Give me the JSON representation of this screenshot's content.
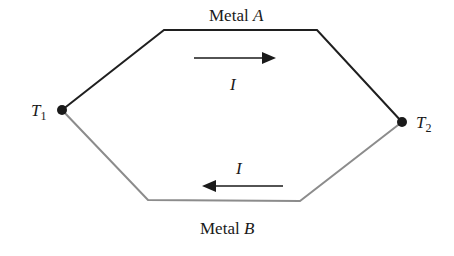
{
  "diagram": {
    "type": "thermocouple-circuit",
    "metal_a": {
      "label_prefix": "Metal",
      "label_var": "A",
      "color": "#1f1f1f"
    },
    "metal_b": {
      "label_prefix": "Metal",
      "label_var": "B",
      "color": "#8c8c8c"
    },
    "junctions": [
      {
        "symbol": "T",
        "subscript": "1"
      },
      {
        "symbol": "T",
        "subscript": "2"
      }
    ],
    "current_top": {
      "label": "I",
      "direction": "right"
    },
    "current_bottom": {
      "label": "I",
      "direction": "left"
    }
  }
}
